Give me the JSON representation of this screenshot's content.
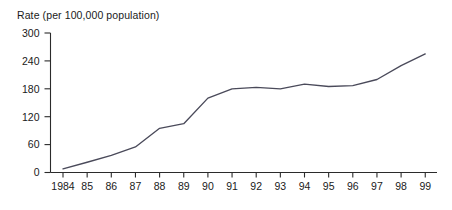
{
  "chart_data": {
    "type": "line",
    "title": "Rate (per 100,000 population)",
    "xlabel": "",
    "ylabel": "Rate (per 100,000 population)",
    "categories": [
      "1984",
      "85",
      "86",
      "87",
      "88",
      "89",
      "90",
      "91",
      "92",
      "93",
      "94",
      "95",
      "96",
      "97",
      "98",
      "99"
    ],
    "x": [
      1984,
      1985,
      1986,
      1987,
      1988,
      1989,
      1990,
      1991,
      1992,
      1993,
      1994,
      1995,
      1996,
      1997,
      1998,
      1999
    ],
    "values": [
      8,
      22,
      37,
      55,
      95,
      105,
      160,
      180,
      183,
      180,
      190,
      185,
      187,
      200,
      230,
      255
    ],
    "series": [
      {
        "name": "Rate",
        "values": [
          8,
          22,
          37,
          55,
          95,
          105,
          160,
          180,
          183,
          180,
          190,
          185,
          187,
          200,
          230,
          255
        ]
      }
    ],
    "ylim": [
      0,
      300
    ],
    "yticks": [
      0,
      60,
      120,
      180,
      240,
      300
    ],
    "ytick_labels": [
      "0",
      "60",
      "120",
      "180",
      "240",
      "300"
    ],
    "xlim": [
      1984,
      1999
    ],
    "grid": false,
    "legend": false,
    "legend_position": "none",
    "line_color": "#4a4a5a",
    "axis_color": "#2b2b2b",
    "background_color": "#ffffff"
  }
}
